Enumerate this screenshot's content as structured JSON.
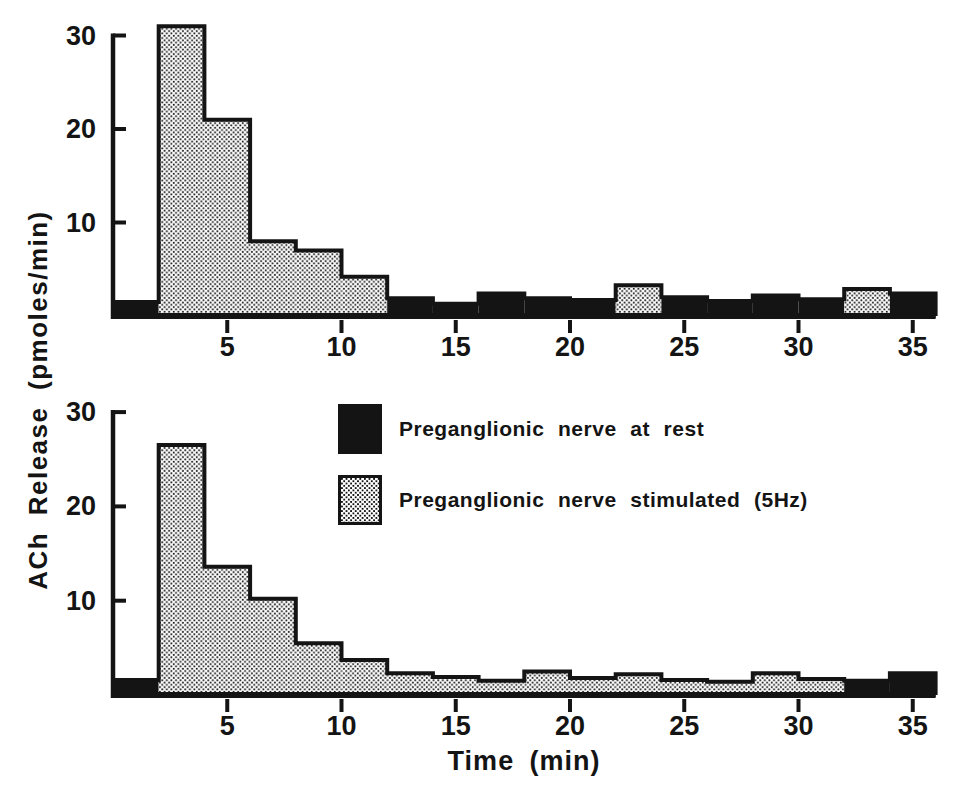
{
  "figure": {
    "y_axis_label": "ACh Release (pmoles/min)",
    "x_axis_label": "Time (min)"
  },
  "colors": {
    "ink": "#141414",
    "paper": "#ffffff"
  },
  "legend": {
    "items": [
      {
        "id": "rest",
        "swatch": "solid-black",
        "label": "Preganglionic nerve at rest"
      },
      {
        "id": "stim",
        "swatch": "stippled",
        "label": "Preganglionic nerve stimulated (5Hz)"
      }
    ]
  },
  "chart_data": [
    {
      "panel": "top",
      "type": "bar",
      "title": "",
      "xlabel": "Time (min)",
      "ylabel": "ACh Release (pmoles/min)",
      "xlim": [
        0,
        36
      ],
      "ylim": [
        0,
        32
      ],
      "xticks": [
        5,
        10,
        15,
        20,
        25,
        30,
        35
      ],
      "yticks": [
        10,
        20,
        30
      ],
      "bin_width_min": 2,
      "series_legend": {
        "rest": "Preganglionic nerve at rest",
        "stim": "Preganglionic nerve stimulated (5Hz)"
      },
      "bins": [
        {
          "t0": 0,
          "t1": 2,
          "value": 1.5,
          "series": "rest"
        },
        {
          "t0": 2,
          "t1": 4,
          "value": 31,
          "series": "stim"
        },
        {
          "t0": 4,
          "t1": 6,
          "value": 21,
          "series": "stim"
        },
        {
          "t0": 6,
          "t1": 8,
          "value": 8,
          "series": "stim"
        },
        {
          "t0": 8,
          "t1": 10,
          "value": 7,
          "series": "stim"
        },
        {
          "t0": 10,
          "t1": 12,
          "value": 4.2,
          "series": "stim"
        },
        {
          "t0": 12,
          "t1": 14,
          "value": 1.9,
          "series": "rest"
        },
        {
          "t0": 14,
          "t1": 16,
          "value": 1.3,
          "series": "rest"
        },
        {
          "t0": 16,
          "t1": 18,
          "value": 2.4,
          "series": "rest"
        },
        {
          "t0": 18,
          "t1": 20,
          "value": 1.9,
          "series": "rest"
        },
        {
          "t0": 20,
          "t1": 22,
          "value": 1.7,
          "series": "rest"
        },
        {
          "t0": 22,
          "t1": 24,
          "value": 3.3,
          "series": "stim"
        },
        {
          "t0": 24,
          "t1": 26,
          "value": 2.0,
          "series": "rest"
        },
        {
          "t0": 26,
          "t1": 28,
          "value": 1.6,
          "series": "rest"
        },
        {
          "t0": 28,
          "t1": 30,
          "value": 2.2,
          "series": "rest"
        },
        {
          "t0": 30,
          "t1": 32,
          "value": 1.8,
          "series": "rest"
        },
        {
          "t0": 32,
          "t1": 34,
          "value": 2.9,
          "series": "stim"
        },
        {
          "t0": 34,
          "t1": 36,
          "value": 2.4,
          "series": "rest"
        }
      ]
    },
    {
      "panel": "bottom",
      "type": "bar",
      "title": "",
      "xlabel": "Time (min)",
      "ylabel": "ACh Release (pmoles/min)",
      "xlim": [
        0,
        36
      ],
      "ylim": [
        0,
        32
      ],
      "xticks": [
        5,
        10,
        15,
        20,
        25,
        30,
        35
      ],
      "yticks": [
        10,
        20,
        30
      ],
      "bin_width_min": 2,
      "series_legend": {
        "rest": "Preganglionic nerve at rest",
        "stim": "Preganglionic nerve stimulated (5Hz)"
      },
      "bins": [
        {
          "t0": 0,
          "t1": 2,
          "value": 1.6,
          "series": "rest"
        },
        {
          "t0": 2,
          "t1": 4,
          "value": 26.5,
          "series": "stim"
        },
        {
          "t0": 4,
          "t1": 6,
          "value": 13.6,
          "series": "stim"
        },
        {
          "t0": 6,
          "t1": 8,
          "value": 10.2,
          "series": "stim"
        },
        {
          "t0": 8,
          "t1": 10,
          "value": 5.5,
          "series": "stim"
        },
        {
          "t0": 10,
          "t1": 12,
          "value": 3.7,
          "series": "stim"
        },
        {
          "t0": 12,
          "t1": 14,
          "value": 2.3,
          "series": "stim"
        },
        {
          "t0": 14,
          "t1": 16,
          "value": 1.9,
          "series": "stim"
        },
        {
          "t0": 16,
          "t1": 18,
          "value": 1.5,
          "series": "stim"
        },
        {
          "t0": 18,
          "t1": 20,
          "value": 2.5,
          "series": "stim"
        },
        {
          "t0": 20,
          "t1": 22,
          "value": 1.8,
          "series": "stim"
        },
        {
          "t0": 22,
          "t1": 24,
          "value": 2.2,
          "series": "stim"
        },
        {
          "t0": 24,
          "t1": 26,
          "value": 1.6,
          "series": "stim"
        },
        {
          "t0": 26,
          "t1": 28,
          "value": 1.4,
          "series": "stim"
        },
        {
          "t0": 28,
          "t1": 30,
          "value": 2.3,
          "series": "stim"
        },
        {
          "t0": 30,
          "t1": 32,
          "value": 1.7,
          "series": "stim"
        },
        {
          "t0": 32,
          "t1": 34,
          "value": 1.5,
          "series": "rest"
        },
        {
          "t0": 34,
          "t1": 36,
          "value": 2.3,
          "series": "rest"
        }
      ]
    }
  ]
}
